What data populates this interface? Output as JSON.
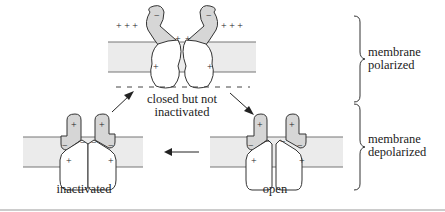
{
  "diagram": {
    "type": "sodium-channel-states",
    "states": [
      {
        "id": "closed",
        "label_line1": "closed but not",
        "label_line2": "inactivated",
        "position": "top-center"
      },
      {
        "id": "open",
        "label": "open",
        "position": "bottom-right"
      },
      {
        "id": "inactivated",
        "label": "inactivated",
        "position": "bottom-left"
      }
    ],
    "transitions": [
      {
        "from": "closed",
        "to": "open"
      },
      {
        "from": "open",
        "to": "inactivated"
      },
      {
        "from": "inactivated",
        "to": "closed"
      }
    ],
    "braces": [
      {
        "label_line1": "membrane",
        "label_line2": "polarized"
      },
      {
        "label_line1": "membrane",
        "label_line2": "depolarized"
      }
    ],
    "charges": {
      "outside_top": "+ + +",
      "inside_top": "— — — —",
      "plus": "+",
      "minus": "−"
    }
  }
}
